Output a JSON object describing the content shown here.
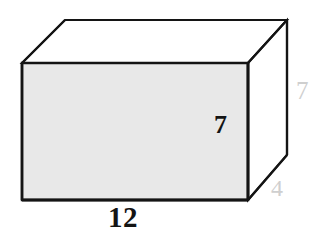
{
  "figure": {
    "name": "rectangular-prism",
    "shape_type": "rectangular prism",
    "canvas": {
      "width": 315,
      "height": 241
    },
    "colors": {
      "outline": "#141414",
      "front_face_fill": "#e8e8e8",
      "top_face_fill": "#ffffff",
      "side_face_fill": "#ffffff",
      "background": "#ffffff",
      "primary_label": "#141414",
      "faint_label": "#cfcfcf"
    },
    "vertices": {
      "front_top_left": [
        22,
        63
      ],
      "front_top_right": [
        248,
        63
      ],
      "front_bottom_left": [
        22,
        200
      ],
      "front_bottom_right": [
        248,
        200
      ],
      "back_top_left": [
        65,
        20
      ],
      "back_top_right": [
        287,
        20
      ],
      "back_bottom_right": [
        287,
        155
      ]
    }
  },
  "labels": {
    "length": {
      "value": "12",
      "semantic": "length",
      "edge": "front-bottom",
      "style": "primary"
    },
    "height_front": {
      "value": "7",
      "semantic": "height",
      "edge": "front-right-vertical",
      "style": "primary"
    },
    "height_side": {
      "value": "7",
      "semantic": "height",
      "edge": "back-right-vertical",
      "style": "faint"
    },
    "depth": {
      "value": "4",
      "semantic": "depth",
      "edge": "bottom-right-diagonal",
      "style": "faint"
    }
  },
  "watermark": {
    "line_one": "              ",
    "line_two": "              "
  }
}
